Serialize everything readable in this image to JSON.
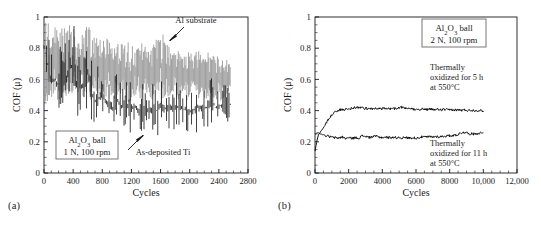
{
  "figure": {
    "panels": [
      {
        "id": "a",
        "label": "(a)",
        "axis": {
          "ylabel": "COF (μ)",
          "xlabel": "Cycles",
          "yticks": [
            "0",
            "0.2",
            "0.4",
            "0.6",
            "0.8",
            "1"
          ],
          "xticks": [
            "0",
            "400",
            "800",
            "1200",
            "1600",
            "2000",
            "2400",
            "2800"
          ],
          "xlim": [
            0,
            2800
          ],
          "ylim": [
            0,
            1
          ]
        },
        "legend_box": {
          "line1_pre": "Al",
          "line1_sub": "2",
          "line1_mid": "O",
          "line1_sub2": "3",
          "line1_post": " ball",
          "line2": "1 N, 100 rpm"
        },
        "annotations": [
          {
            "name": "al-substrate",
            "text": "Al substrate"
          },
          {
            "name": "as-deposited-ti",
            "text": "As-deposited Ti"
          }
        ]
      },
      {
        "id": "b",
        "label": "(b)",
        "axis": {
          "ylabel": "COF (μ)",
          "xlabel": "Cycles",
          "yticks": [
            "0",
            "0.2",
            "0.4",
            "0.6",
            "0.8",
            "1"
          ],
          "xticks": [
            "0",
            "2000",
            "4000",
            "6000",
            "8000",
            "10,000",
            "12,000"
          ],
          "xlim": [
            0,
            12000
          ],
          "ylim": [
            0,
            1
          ]
        },
        "legend_box": {
          "line1_pre": "Al",
          "line1_sub": "2",
          "line1_mid": "O",
          "line1_sub2": "3",
          "line1_post": " ball",
          "line2": "2 N, 100 rpm"
        },
        "annotations": [
          {
            "name": "oxidized-5h",
            "l1": "Thermally",
            "l2": "oxidized for 5 h",
            "l3": "at 550°C"
          },
          {
            "name": "oxidized-11h",
            "l1": "Thermally",
            "l2": "oxidized for 11 h",
            "l3": "at 550°C"
          }
        ]
      }
    ]
  },
  "colors": {
    "axis": "#1a1a1a",
    "gray_trace": "#9a9a9a",
    "black_trace": "#111111",
    "background": "#ffffff",
    "box_border": "#555555"
  },
  "chart_data": [
    {
      "type": "line",
      "panel": "a",
      "title": "",
      "xlabel": "Cycles",
      "ylabel": "COF (μ)",
      "xlim": [
        0,
        2800
      ],
      "ylim": [
        0,
        1
      ],
      "xticks": [
        0,
        400,
        800,
        1200,
        1600,
        2000,
        2400,
        2800
      ],
      "yticks": [
        0,
        0.2,
        0.4,
        0.6,
        0.8,
        1
      ],
      "grid": false,
      "legend_position": "inline-annotations",
      "notes": "Highly noisy coefficient-of-friction traces; values below are the band envelope (min/max) sampled every 50 cycles.",
      "series": [
        {
          "name": "Al substrate",
          "color": "#9a9a9a",
          "x": [
            0,
            50,
            100,
            150,
            200,
            250,
            300,
            350,
            400,
            450,
            500,
            550,
            600,
            650,
            700,
            750,
            800,
            850,
            900,
            950,
            1000,
            1050,
            1100,
            1150,
            1200,
            1250,
            1300,
            1350,
            1400,
            1450,
            1500,
            1550,
            1600,
            1650,
            1700,
            1750,
            1800,
            1850,
            1900,
            1950,
            2000,
            2050,
            2100,
            2150,
            2200,
            2250,
            2300,
            2350,
            2400,
            2450,
            2500,
            2550
          ],
          "upper": [
            1.0,
            0.97,
            0.93,
            0.95,
            0.91,
            0.94,
            0.92,
            0.98,
            0.96,
            0.9,
            0.88,
            0.93,
            0.97,
            0.89,
            0.86,
            0.88,
            0.91,
            0.87,
            0.85,
            0.83,
            0.86,
            0.84,
            0.82,
            0.85,
            0.83,
            0.8,
            0.82,
            0.84,
            0.81,
            0.79,
            0.83,
            0.86,
            0.95,
            0.88,
            0.82,
            0.8,
            0.78,
            0.79,
            0.77,
            0.8,
            0.78,
            0.76,
            0.79,
            0.77,
            0.75,
            0.78,
            0.76,
            0.74,
            0.77,
            0.75,
            0.73,
            0.7
          ],
          "lower": [
            0.46,
            0.44,
            0.48,
            0.45,
            0.47,
            0.43,
            0.49,
            0.46,
            0.44,
            0.48,
            0.5,
            0.45,
            0.43,
            0.47,
            0.49,
            0.46,
            0.44,
            0.48,
            0.5,
            0.47,
            0.45,
            0.49,
            0.47,
            0.44,
            0.46,
            0.5,
            0.48,
            0.45,
            0.47,
            0.49,
            0.46,
            0.44,
            0.42,
            0.46,
            0.48,
            0.5,
            0.49,
            0.47,
            0.48,
            0.46,
            0.49,
            0.5,
            0.47,
            0.48,
            0.46,
            0.49,
            0.47,
            0.48,
            0.46,
            0.45,
            0.47,
            0.48
          ],
          "mean": [
            0.72,
            0.7,
            0.71,
            0.7,
            0.69,
            0.68,
            0.7,
            0.72,
            0.7,
            0.69,
            0.68,
            0.69,
            0.7,
            0.68,
            0.67,
            0.67,
            0.67,
            0.67,
            0.67,
            0.65,
            0.65,
            0.66,
            0.64,
            0.64,
            0.64,
            0.65,
            0.65,
            0.64,
            0.64,
            0.64,
            0.64,
            0.65,
            0.68,
            0.67,
            0.65,
            0.65,
            0.63,
            0.63,
            0.62,
            0.63,
            0.63,
            0.63,
            0.63,
            0.62,
            0.6,
            0.63,
            0.61,
            0.61,
            0.61,
            0.6,
            0.6,
            0.59
          ]
        },
        {
          "name": "As-deposited Ti",
          "color": "#111111",
          "x": [
            0,
            50,
            100,
            150,
            200,
            250,
            300,
            350,
            400,
            450,
            500,
            550,
            600,
            650,
            700,
            750,
            800,
            850,
            900,
            950,
            1000,
            1050,
            1100,
            1150,
            1200,
            1250,
            1300,
            1350,
            1400,
            1450,
            1500,
            1550,
            1600,
            1650,
            1700,
            1750,
            1800,
            1850,
            1900,
            1950,
            2000,
            2050,
            2100,
            2150,
            2200,
            2250,
            2300,
            2350,
            2400,
            2450,
            2500,
            2550
          ],
          "upper": [
            1.0,
            0.88,
            0.82,
            0.84,
            0.8,
            0.85,
            0.88,
            1.0,
            0.99,
            0.82,
            0.78,
            0.86,
            0.96,
            0.76,
            0.7,
            0.68,
            0.72,
            0.66,
            0.63,
            0.6,
            0.64,
            0.62,
            0.58,
            0.62,
            0.66,
            0.57,
            0.55,
            0.58,
            0.56,
            0.54,
            0.6,
            0.64,
            0.72,
            0.6,
            0.56,
            0.54,
            0.58,
            0.62,
            0.55,
            0.57,
            0.54,
            0.52,
            0.56,
            0.58,
            0.53,
            0.6,
            0.66,
            0.56,
            0.58,
            0.6,
            0.62,
            0.54
          ],
          "lower": [
            0.62,
            0.52,
            0.4,
            0.44,
            0.38,
            0.42,
            0.36,
            0.46,
            0.44,
            0.34,
            0.32,
            0.4,
            0.42,
            0.3,
            0.28,
            0.32,
            0.34,
            0.3,
            0.28,
            0.26,
            0.32,
            0.3,
            0.26,
            0.28,
            0.24,
            0.3,
            0.28,
            0.26,
            0.3,
            0.28,
            0.24,
            0.22,
            0.26,
            0.24,
            0.28,
            0.3,
            0.26,
            0.24,
            0.28,
            0.26,
            0.08,
            0.22,
            0.26,
            0.24,
            0.28,
            0.26,
            0.3,
            0.28,
            0.26,
            0.3,
            0.32,
            0.34
          ],
          "mean": [
            0.8,
            0.7,
            0.58,
            0.6,
            0.56,
            0.6,
            0.58,
            0.7,
            0.68,
            0.56,
            0.52,
            0.6,
            0.66,
            0.5,
            0.46,
            0.48,
            0.5,
            0.46,
            0.44,
            0.42,
            0.46,
            0.44,
            0.42,
            0.44,
            0.42,
            0.42,
            0.4,
            0.42,
            0.42,
            0.4,
            0.4,
            0.4,
            0.44,
            0.41,
            0.42,
            0.42,
            0.42,
            0.42,
            0.41,
            0.41,
            0.4,
            0.4,
            0.42,
            0.42,
            0.41,
            0.43,
            0.46,
            0.42,
            0.43,
            0.44,
            0.46,
            0.44
          ]
        }
      ]
    },
    {
      "type": "line",
      "panel": "b",
      "title": "",
      "xlabel": "Cycles",
      "ylabel": "COF (μ)",
      "xlim": [
        0,
        12000
      ],
      "ylim": [
        0,
        1
      ],
      "xticks": [
        0,
        2000,
        4000,
        6000,
        8000,
        10000,
        12000
      ],
      "yticks": [
        0,
        0.2,
        0.4,
        0.6,
        0.8,
        1
      ],
      "grid": false,
      "legend_position": "inline-annotations",
      "series": [
        {
          "name": "Thermally oxidized for 5 h at 550°C",
          "color": "#111111",
          "x": [
            0,
            100,
            200,
            300,
            400,
            500,
            600,
            700,
            800,
            900,
            1000,
            1100,
            1200,
            1300,
            1400,
            1500,
            1700,
            1900,
            2100,
            2300,
            2500,
            2700,
            2900,
            3100,
            3300,
            3500,
            3700,
            3900,
            4100,
            4300,
            4500,
            4700,
            4900,
            5100,
            5300,
            5500,
            5700,
            5900,
            6100,
            6300,
            6500,
            6700,
            6900,
            7100,
            7300,
            7500,
            7700,
            7900,
            8100,
            8300,
            8500,
            8700,
            8900,
            9100,
            9300,
            9500,
            9700,
            9900,
            10000
          ],
          "y": [
            0.14,
            0.2,
            0.245,
            0.26,
            0.275,
            0.29,
            0.305,
            0.325,
            0.345,
            0.36,
            0.375,
            0.385,
            0.392,
            0.398,
            0.402,
            0.405,
            0.406,
            0.41,
            0.412,
            0.418,
            0.421,
            0.419,
            0.415,
            0.412,
            0.415,
            0.412,
            0.414,
            0.411,
            0.413,
            0.41,
            0.412,
            0.414,
            0.411,
            0.425,
            0.413,
            0.41,
            0.412,
            0.409,
            0.411,
            0.408,
            0.41,
            0.407,
            0.409,
            0.406,
            0.408,
            0.405,
            0.407,
            0.404,
            0.406,
            0.403,
            0.405,
            0.402,
            0.404,
            0.401,
            0.403,
            0.4,
            0.402,
            0.399,
            0.398
          ]
        },
        {
          "name": "Thermally oxidized for 11 h at 550°C",
          "color": "#111111",
          "x": [
            0,
            100,
            200,
            300,
            400,
            500,
            600,
            700,
            800,
            900,
            1000,
            1100,
            1200,
            1400,
            1600,
            1800,
            2000,
            2200,
            2400,
            2600,
            2800,
            3000,
            3200,
            3400,
            3600,
            3800,
            4000,
            4200,
            4400,
            4600,
            4800,
            5000,
            5200,
            5400,
            5600,
            5800,
            6000,
            6200,
            6400,
            6600,
            6800,
            7000,
            7200,
            7400,
            7600,
            7800,
            8000,
            8200,
            8400,
            8600,
            8800,
            9000,
            9200,
            9400,
            9600,
            9800,
            10000
          ],
          "y": [
            0.25,
            0.255,
            0.258,
            0.252,
            0.248,
            0.245,
            0.242,
            0.238,
            0.235,
            0.232,
            0.23,
            0.228,
            0.226,
            0.224,
            0.232,
            0.222,
            0.225,
            0.223,
            0.226,
            0.224,
            0.238,
            0.236,
            0.228,
            0.232,
            0.236,
            0.23,
            0.228,
            0.23,
            0.227,
            0.229,
            0.226,
            0.228,
            0.225,
            0.227,
            0.224,
            0.226,
            0.223,
            0.228,
            0.232,
            0.23,
            0.233,
            0.231,
            0.234,
            0.232,
            0.235,
            0.237,
            0.239,
            0.241,
            0.244,
            0.252,
            0.262,
            0.258,
            0.252,
            0.25,
            0.253,
            0.256,
            0.258
          ]
        }
      ]
    }
  ]
}
